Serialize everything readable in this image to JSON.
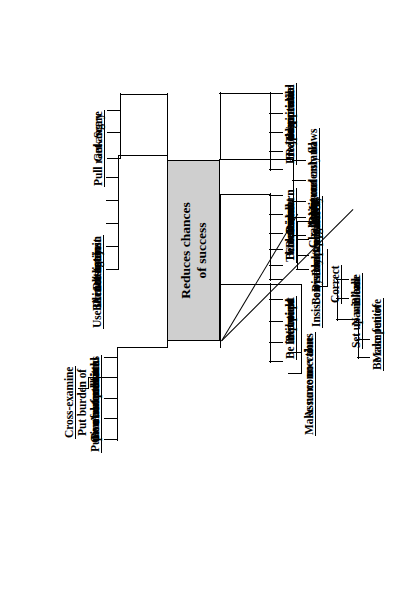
{
  "diagram": {
    "type": "mind-map",
    "orientation": "rotated-90-counterclockwise",
    "central": {
      "line1": "Reduces chances",
      "line2": "of success",
      "fill": "#cfcfcf",
      "stroke": "#000000"
    },
    "branches": [
      {
        "id": "aggression",
        "items": [
          {
            "label": "Pull rank"
          },
          {
            "label": "Get angry"
          },
          {
            "label": "Scare"
          }
        ]
      },
      {
        "id": "withdrawal",
        "items": [
          {
            "label": "Act distant"
          },
          {
            "label": "Be inattentive"
          },
          {
            "label": "Do not listen"
          },
          {
            "label": "Do not join"
          },
          {
            "label": "Use silence against"
          }
        ]
      },
      {
        "id": "burden-of-proof",
        "items": [
          {
            "label": "Put burden of"
          },
          {
            "label": "proof on others"
          },
          {
            "label": "Ask questions"
          },
          {
            "label": "Cross-examine"
          },
          {
            "label": "Give no feedback"
          },
          {
            "label": "Be noncommittal"
          },
          {
            "label": "Put on a stone face"
          }
        ]
      },
      {
        "id": "impatience",
        "items": [
          {
            "label": "Be impatient"
          },
          {
            "label": "Nit pick"
          },
          {
            "label": "Interrupt"
          },
          {
            "label": "Be bored"
          }
        ]
      },
      {
        "id": "dominance",
        "items": [
          {
            "label": "Be dominant"
          },
          {
            "label": "Command"
          },
          {
            "label": "Order"
          },
          {
            "label": "Direct"
          },
          {
            "label": "Threaten/warn"
          },
          {
            "label": "Demand"
          }
        ]
      },
      {
        "id": "devaluing",
        "items": [
          {
            "label": "Assume no value"
          },
          {
            "label": "Make no connections"
          }
        ]
      },
      {
        "id": "negativity",
        "items": [
          {
            "label": "Be pessimistic"
          },
          {
            "label": "Preach/moralize"
          },
          {
            "label": "Be judgemental"
          },
          {
            "label": "Be critical"
          },
          {
            "label": "Disapprove"
          }
        ]
      },
      {
        "id": "fault-finding",
        "items": [
          {
            "label": "Point out only flaws"
          },
          {
            "label": "Misunderstand"
          },
          {
            "label": "Disagree"
          },
          {
            "label": "Argue"
          },
          {
            "label": "Challenge"
          }
        ]
      },
      {
        "id": "negative-reaction",
        "items": [
          {
            "label": "React negatively"
          },
          {
            "label": "Discount/put down"
          },
          {
            "label": "Be cynical/sceptical"
          },
          {
            "label": "Insist on early precision"
          },
          {
            "label": "Correct"
          }
        ]
      },
      {
        "id": "competition",
        "items": [
          {
            "label": "Blame"
          },
          {
            "label": "Name call"
          },
          {
            "label": "Set up win/lose"
          },
          {
            "label": "Be competitive"
          },
          {
            "label": "Make fun of"
          }
        ]
      }
    ]
  }
}
